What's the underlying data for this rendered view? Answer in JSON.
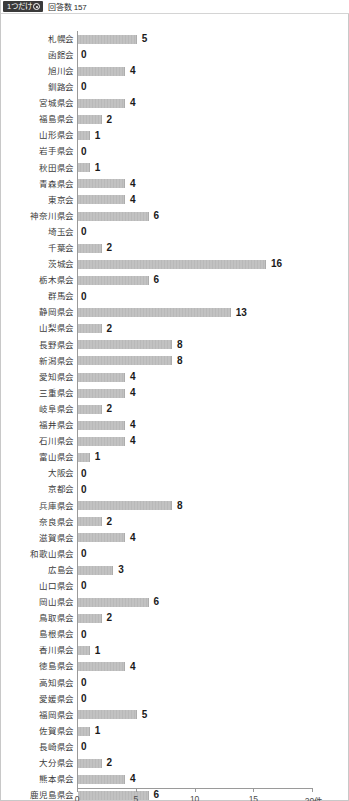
{
  "header": {
    "question_type_badge": "1つだけ",
    "badge_icon": "radio-button-icon",
    "response_label": "回答数",
    "response_count": "157"
  },
  "colors": {
    "bar": "#c2c2c2",
    "bar_edge": "#adadad",
    "badge_bg": "#3a3a3a",
    "axis": "#9a9a9a",
    "label_text": "#3b3b3b",
    "value_text": "#1a1a1a"
  },
  "chart_data": {
    "type": "bar",
    "orientation": "horizontal",
    "title": "",
    "xlabel": "",
    "ylabel": "",
    "xlim": [
      0,
      20
    ],
    "xticks": [
      0,
      5,
      10,
      15,
      20
    ],
    "xtick_labels": [
      "0",
      "5",
      "10",
      "15",
      "20件"
    ],
    "unit": "件",
    "grid": false,
    "legend": null,
    "total": 157,
    "categories": [
      "札幌会",
      "函館会",
      "旭川会",
      "釧路会",
      "宮城県会",
      "福島県会",
      "山形県会",
      "岩手県会",
      "秋田県会",
      "青森県会",
      "東京会",
      "神奈川県会",
      "埼玉会",
      "千葉会",
      "茨城会",
      "栃木県会",
      "群馬会",
      "静岡県会",
      "山梨県会",
      "長野県会",
      "新潟県会",
      "愛知県会",
      "三重県会",
      "岐阜県会",
      "福井県会",
      "石川県会",
      "富山県会",
      "大阪会",
      "京都会",
      "兵庫県会",
      "奈良県会",
      "滋賀県会",
      "和歌山県会",
      "広島会",
      "山口県会",
      "岡山県会",
      "鳥取県会",
      "島根県会",
      "香川県会",
      "徳島県会",
      "高知県会",
      "愛媛県会",
      "福岡県会",
      "佐賀県会",
      "長崎県会",
      "大分県会",
      "熊本県会",
      "鹿児島県会",
      "宮崎県会",
      "沖縄県会"
    ],
    "values": [
      5,
      0,
      4,
      0,
      4,
      2,
      1,
      0,
      1,
      4,
      4,
      6,
      0,
      2,
      16,
      6,
      0,
      13,
      2,
      8,
      8,
      4,
      4,
      2,
      4,
      4,
      1,
      0,
      0,
      8,
      2,
      4,
      0,
      3,
      0,
      6,
      2,
      0,
      1,
      4,
      0,
      0,
      5,
      1,
      0,
      2,
      4,
      6,
      3,
      1
    ]
  }
}
